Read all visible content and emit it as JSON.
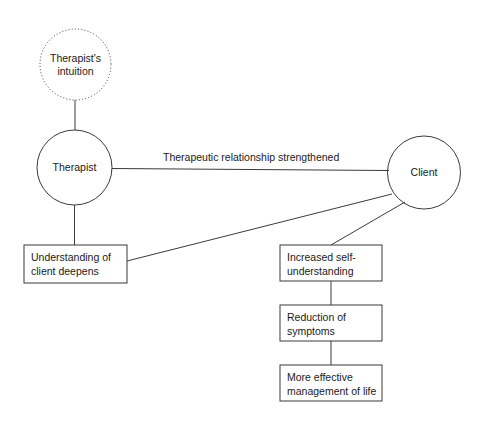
{
  "diagram": {
    "type": "flow-diagram",
    "background_color": "#ffffff",
    "stroke_color": "#3a3a3a",
    "text_color": "#1a1a1a",
    "nodes": {
      "intuition": {
        "label": "Therapist's\nintuition",
        "shape": "circle",
        "border_style": "dotted",
        "cx": 75.5,
        "cy": 64.5,
        "r": 35.5
      },
      "therapist": {
        "label": "Therapist",
        "shape": "circle",
        "border_style": "solid",
        "cx": 74.5,
        "cy": 167.5,
        "r": 37.5
      },
      "client": {
        "label": "Client",
        "shape": "circle",
        "border_style": "solid",
        "cx": 424.0,
        "cy": 172.5,
        "r": 36.5
      },
      "understanding": {
        "label": "Understanding of\nclient deepens",
        "shape": "rect",
        "x": 24,
        "y": 245,
        "w": 103,
        "h": 38
      },
      "self_understanding": {
        "label": "Increased self-\nunderstanding",
        "shape": "rect",
        "x": 280,
        "y": 245,
        "w": 102,
        "h": 36
      },
      "reduction": {
        "label": "Reduction of\nsymptoms",
        "shape": "rect",
        "x": 280,
        "y": 305,
        "w": 102,
        "h": 36
      },
      "management": {
        "label": "More effective\nmanagement of life",
        "shape": "rect",
        "x": 280,
        "y": 365,
        "w": 102,
        "h": 36
      }
    },
    "edges": [
      {
        "name": "intuition-to-therapist",
        "from": "intuition",
        "to": "therapist",
        "label": ""
      },
      {
        "name": "therapist-to-client",
        "from": "therapist",
        "to": "client",
        "label": "Therapeutic relationship strengthened"
      },
      {
        "name": "therapist-to-understanding",
        "from": "therapist",
        "to": "understanding",
        "label": ""
      },
      {
        "name": "client-to-understanding",
        "from": "client",
        "to": "understanding",
        "label": ""
      },
      {
        "name": "client-to-self-understanding",
        "from": "client",
        "to": "self_understanding",
        "label": ""
      },
      {
        "name": "self-understanding-to-reduction",
        "from": "self_understanding",
        "to": "reduction",
        "label": ""
      },
      {
        "name": "reduction-to-management",
        "from": "reduction",
        "to": "management",
        "label": ""
      }
    ]
  }
}
